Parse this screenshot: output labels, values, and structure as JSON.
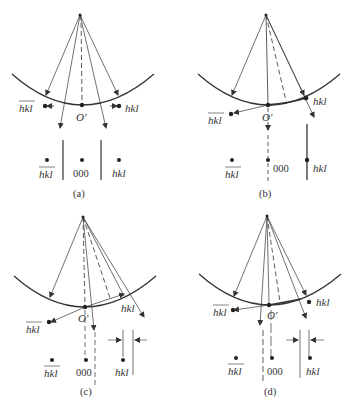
{
  "figure": {
    "panels": [
      {
        "id": "a",
        "caption": "(a)",
        "origin_label": "O′",
        "spot_left": "hkl",
        "spot_center": "000",
        "spot_right": "hkl",
        "reflection_right": "hkl",
        "reflection_left": "hkl"
      },
      {
        "id": "b",
        "caption": "(b)",
        "origin_label": "O′",
        "spot_left": "hkl",
        "spot_center": "000",
        "spot_right": "hkl",
        "reflection_right": "hkl",
        "reflection_left": "hkl"
      },
      {
        "id": "c",
        "caption": "(c)",
        "origin_label": "O′",
        "spot_left": "hkl",
        "spot_center": "000",
        "spot_right": "hkl",
        "reflection_right": "hkl",
        "reflection_left": "hkl"
      },
      {
        "id": "d",
        "caption": "(d)",
        "origin_label": "O′",
        "spot_left": "hkl",
        "spot_center": "000",
        "spot_right": "hkl",
        "reflection_right": "hkl",
        "reflection_left": "hkl"
      }
    ],
    "colors": {
      "line": "#333333",
      "background": "#ffffff"
    }
  }
}
